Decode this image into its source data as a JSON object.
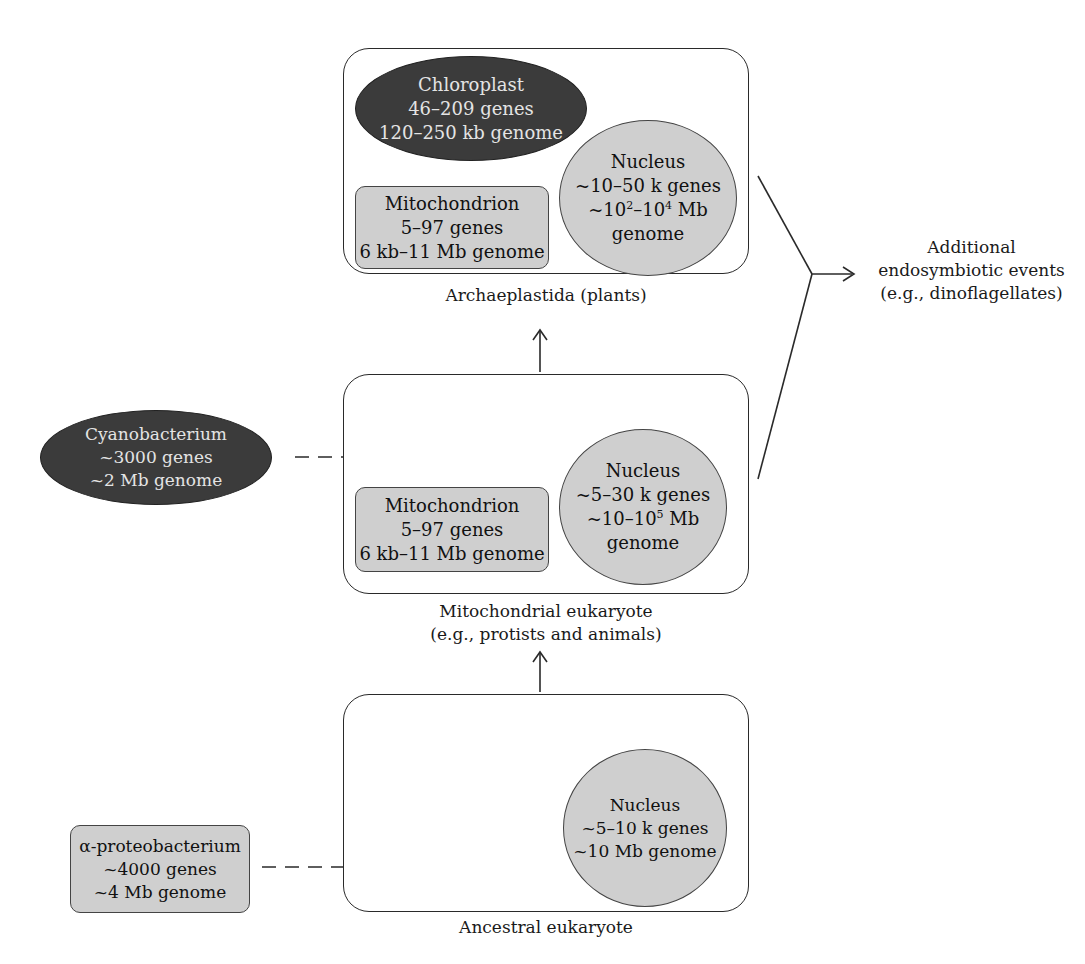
{
  "diagram": {
    "type": "endosymbiosis-flow",
    "stages": {
      "plants": {
        "caption": "Archaeplastida (plants)",
        "chloroplast": {
          "title": "Chloroplast",
          "genes": "46–209 genes",
          "genome": "120–250 kb genome"
        },
        "mitochondrion": {
          "title": "Mitochondrion",
          "genes": "5–97 genes",
          "genome": "6 kb–11 Mb genome"
        },
        "nucleus": {
          "title": "Nucleus",
          "genes": "~10–50 k genes",
          "genome_prefix": "~10",
          "genome_sup1": "2",
          "genome_mid": "–10",
          "genome_sup2": "4",
          "genome_suffix": " Mb",
          "genome_line2": "genome"
        }
      },
      "mito_eukaryote": {
        "caption_line1": "Mitochondrial eukaryote",
        "caption_line2": "(e.g., protists and animals)",
        "mitochondrion": {
          "title": "Mitochondrion",
          "genes": "5–97 genes",
          "genome": "6 kb–11 Mb genome"
        },
        "nucleus": {
          "title": "Nucleus",
          "genes": "~5–30 k genes",
          "genome_prefix": "~10–10",
          "genome_sup": "5",
          "genome_suffix": " Mb",
          "genome_line2": "genome"
        }
      },
      "ancestral": {
        "caption": "Ancestral eukaryote",
        "nucleus": {
          "title": "Nucleus",
          "genes": "~5–10 k genes",
          "genome": "~10 Mb genome"
        }
      }
    },
    "donors": {
      "cyanobacterium": {
        "title": "Cyanobacterium",
        "genes": "~3000 genes",
        "genome": "~2 Mb genome"
      },
      "alphaproteobacterium": {
        "title": "α-proteobacterium",
        "genes": "~4000 genes",
        "genome": "~4 Mb genome"
      }
    },
    "outcome": {
      "line1": "Additional",
      "line2": "endosymbiotic events",
      "line3": "(e.g., dinoflagellates)"
    },
    "colors": {
      "dark_fill": "#3b3b3b",
      "light_fill": "#cfcfcf",
      "stroke": "#2a2a2a"
    }
  }
}
